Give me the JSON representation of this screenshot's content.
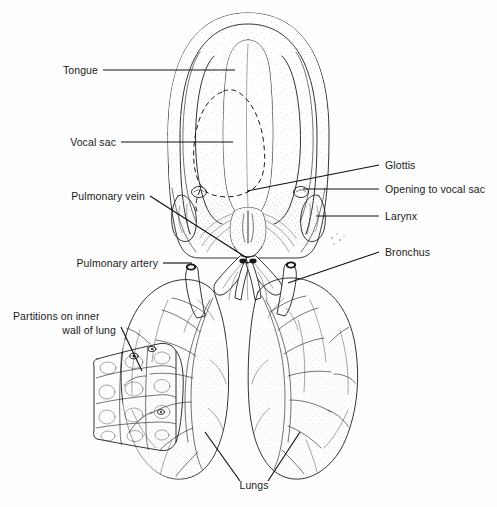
{
  "figure": {
    "background_color": "#fefefe",
    "line_color": "#1c1c1c",
    "text_color": "#1a1a1a"
  },
  "labels": {
    "tongue": "Tongue",
    "vocal_sac": "Vocal sac",
    "pulmonary_vein": "Pulmonary vein",
    "pulmonary_artery": "Pulmonary artery",
    "partitions_line1": "Partitions on inner",
    "partitions_line2": "wall of lung",
    "glottis": "Glottis",
    "opening_to_vocal_sac": "Opening to vocal sac",
    "larynx": "Larynx",
    "bronchus": "Bronchus",
    "lungs": "Lungs"
  },
  "structures": {
    "buccal_cavity": "buccal-cavity",
    "tongue_body": "tongue",
    "vocal_sac_outline": "vocal-sac-dashed-outline",
    "glottis_slit": "glottis",
    "vocal_sac_openings": "vocal-sac-openings",
    "larynx_body": "larynx",
    "bronchi": "bronchi",
    "left_lung": "left-lung",
    "right_lung": "right-lung",
    "cutaway_flap": "lung-wall-cutaway-flap",
    "pulmonary_vessels": "pulmonary-vessels"
  }
}
